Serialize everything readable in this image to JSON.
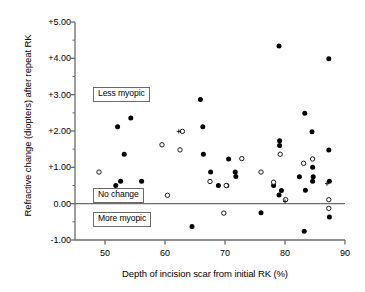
{
  "chart_data": {
    "type": "scatter",
    "title": "",
    "xlabel": "Depth of incision scar from initial RK (%)",
    "ylabel": "Refractive change (diopters) after repeat RK",
    "xlim": [
      45,
      90
    ],
    "ylim": [
      -1.0,
      5.0
    ],
    "xticks": [
      50,
      60,
      70,
      80,
      90
    ],
    "xtick_labels": [
      "50",
      "60",
      "70",
      "80",
      "90"
    ],
    "yticks": [
      -1.0,
      0.0,
      1.0,
      2.0,
      3.0,
      4.0,
      5.0
    ],
    "ytick_labels": [
      "-1.00",
      "0.00",
      "+1.00",
      "+2.00",
      "+3.00",
      "+4.00",
      "+5.00"
    ],
    "yminorticks": [
      -0.5,
      0.5,
      1.5,
      2.5,
      3.5,
      4.5
    ],
    "grid": false,
    "legend": "none",
    "reference_line": {
      "y": 0.0,
      "label": "No change"
    },
    "annotations": [
      {
        "text": "Less myopic",
        "x": 48.0,
        "y": 3.0
      },
      {
        "text": "No change",
        "x": 48.0,
        "y": 0.22
      },
      {
        "text": "More myopic",
        "x": 48.0,
        "y": -0.45
      }
    ],
    "series": [
      {
        "name": "filled",
        "marker": "filled-circle",
        "points": [
          [
            51.8,
            0.5
          ],
          [
            52.1,
            2.12
          ],
          [
            52.6,
            0.62
          ],
          [
            53.2,
            1.36
          ],
          [
            54.3,
            2.36
          ],
          [
            56.1,
            0.62
          ],
          [
            64.5,
            -0.63
          ],
          [
            65.9,
            2.87
          ],
          [
            66.3,
            2.12
          ],
          [
            66.4,
            1.36
          ],
          [
            67.6,
            0.87
          ],
          [
            68.9,
            0.5
          ],
          [
            70.3,
            0.5
          ],
          [
            70.6,
            1.23
          ],
          [
            71.7,
            0.87
          ],
          [
            71.8,
            0.75
          ],
          [
            76.0,
            -0.25
          ],
          [
            78.1,
            0.5
          ],
          [
            79.0,
            4.34
          ],
          [
            79.1,
            1.73
          ],
          [
            79.1,
            1.6
          ],
          [
            79.0,
            0.24
          ],
          [
            79.4,
            0.36
          ],
          [
            82.4,
            0.74
          ],
          [
            83.2,
            -0.76
          ],
          [
            83.3,
            2.49
          ],
          [
            83.4,
            0.37
          ],
          [
            84.5,
            1.98
          ],
          [
            84.6,
            1.0
          ],
          [
            84.7,
            0.74
          ],
          [
            84.6,
            0.62
          ],
          [
            87.3,
            3.99
          ],
          [
            87.3,
            1.48
          ],
          [
            87.4,
            0.62
          ],
          [
            87.4,
            -0.37
          ]
        ]
      },
      {
        "name": "open",
        "marker": "open-circle",
        "points": [
          [
            49.0,
            0.87
          ],
          [
            59.5,
            1.62
          ],
          [
            60.4,
            0.23
          ],
          [
            62.9,
            1.99
          ],
          [
            62.5,
            1.48
          ],
          [
            67.5,
            0.61
          ],
          [
            69.8,
            -0.26
          ],
          [
            70.2,
            0.5
          ],
          [
            72.8,
            1.24
          ],
          [
            76.0,
            0.87
          ],
          [
            78.1,
            0.59
          ],
          [
            79.2,
            1.36
          ],
          [
            80.1,
            0.11
          ],
          [
            83.1,
            1.11
          ],
          [
            84.6,
            1.23
          ],
          [
            87.3,
            0.11
          ],
          [
            87.3,
            -0.13
          ]
        ]
      },
      {
        "name": "plus",
        "marker": "plus",
        "points": [
          [
            62.3,
            1.99
          ],
          [
            80.0,
            0.06
          ],
          [
            87.0,
            0.55
          ]
        ]
      }
    ]
  },
  "axes": {
    "x_title": "Depth of incision scar from initial RK (%)",
    "y_title": "Refractive change (diopters) after repeat RK",
    "x_tick_labels": [
      "50",
      "60",
      "70",
      "80",
      "90"
    ],
    "y_tick_labels": [
      "+5.00",
      "+4.00",
      "+3.00",
      "+2.00",
      "+1.00",
      "0.00",
      "-1.00"
    ]
  },
  "labels": {
    "less_myopic": "Less myopic",
    "no_change": "No change",
    "more_myopic": "More myopic"
  },
  "colors": {
    "marker_fill": "#000000",
    "axis": "#6b6b6b",
    "text": "#000000",
    "background": "#ffffff",
    "box_border": "#6b6b6b"
  }
}
